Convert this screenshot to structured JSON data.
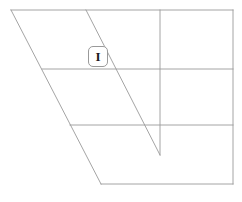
{
  "canvas": {
    "width": 242,
    "height": 202,
    "background_color": "#ffffff",
    "stroke_color": "#9a9a9a",
    "stroke_width": 0.9
  },
  "cursor_badge": {
    "name": "text-cursor-indicator",
    "glyph": "I",
    "x": 88,
    "y": 46,
    "width": 20,
    "height": 21,
    "border_radius": 5,
    "border_color": "#9a9a9a",
    "fill_color": "#ffffff",
    "glyph_color": "#1a1a1a"
  },
  "chart_data": {
    "type": "diagram",
    "title": "",
    "subtitle": "",
    "xlabel": "",
    "ylabel": "",
    "grid": true,
    "legend": false,
    "segments": [
      {
        "name": "top-edge",
        "x1": 11,
        "y1": 10,
        "x2": 233,
        "y2": 10
      },
      {
        "name": "right-edge",
        "x1": 233,
        "y1": 10,
        "x2": 233,
        "y2": 184
      },
      {
        "name": "bottom-edge",
        "x1": 233,
        "y1": 184,
        "x2": 101,
        "y2": 184
      },
      {
        "name": "left-slant-outer",
        "x1": 11,
        "y1": 10,
        "x2": 101,
        "y2": 184
      },
      {
        "name": "left-slant-inner",
        "x1": 86,
        "y1": 10,
        "x2": 160,
        "y2": 155
      },
      {
        "name": "vertical-rule",
        "x1": 160,
        "y1": 10,
        "x2": 160,
        "y2": 155
      },
      {
        "name": "horizontal-rule-upper",
        "x1": 42,
        "y1": 69,
        "x2": 233,
        "y2": 69
      },
      {
        "name": "horizontal-rule-lower",
        "x1": 70,
        "y1": 125,
        "x2": 233,
        "y2": 125
      }
    ]
  }
}
